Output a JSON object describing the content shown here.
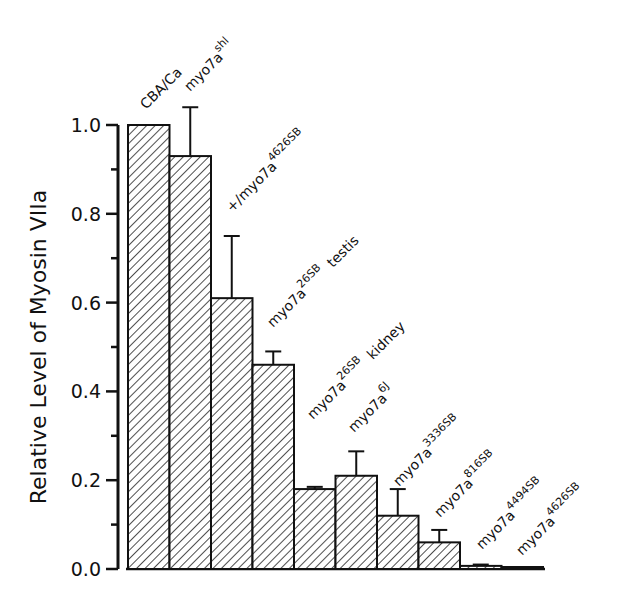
{
  "chart_data": {
    "type": "bar",
    "title": "",
    "xlabel": "",
    "ylabel": "Relative Level of Myosin VIIa",
    "ylim": [
      0,
      1.0
    ],
    "yticks": [
      "0.0",
      "0.2",
      "0.4",
      "0.6",
      "0.8",
      "1.0"
    ],
    "grid": false,
    "legend": null,
    "bar_fill": "diagonal-hatch",
    "categories": [
      {
        "base": "CBA/Ca",
        "sup": "",
        "suffix": ""
      },
      {
        "base": "myo7a",
        "sup": "shl",
        "suffix": ""
      },
      {
        "base": "+/myo7a",
        "sup": "4626SB",
        "suffix": ""
      },
      {
        "base": "myo7a",
        "sup": "26SB",
        "suffix": "testis"
      },
      {
        "base": "myo7a",
        "sup": "26SB",
        "suffix": "kidney"
      },
      {
        "base": "myo7a",
        "sup": "6J",
        "suffix": ""
      },
      {
        "base": "myo7a",
        "sup": "3336SB",
        "suffix": ""
      },
      {
        "base": "myo7a",
        "sup": "816SB",
        "suffix": ""
      },
      {
        "base": "myo7a",
        "sup": "4494SB",
        "suffix": ""
      },
      {
        "base": "myo7a",
        "sup": "4626SB",
        "suffix": ""
      }
    ],
    "values": [
      1.0,
      0.93,
      0.61,
      0.46,
      0.18,
      0.21,
      0.12,
      0.06,
      0.007,
      0.003
    ],
    "error_upper": [
      null,
      1.04,
      0.75,
      0.49,
      0.185,
      0.265,
      0.18,
      0.088,
      0.01,
      null
    ]
  }
}
